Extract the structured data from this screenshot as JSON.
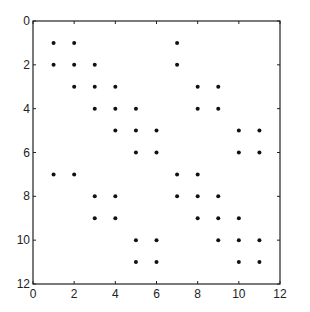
{
  "chart_data": {
    "type": "scatter",
    "subtype": "sparsity-pattern",
    "title": "",
    "xlabel": "",
    "ylabel": "",
    "xlim": [
      0,
      12
    ],
    "ylim": [
      12,
      0
    ],
    "y_inverted": true,
    "grid": false,
    "legend": null,
    "xticks": [
      0,
      2,
      4,
      6,
      8,
      10,
      12
    ],
    "yticks": [
      0,
      2,
      4,
      6,
      8,
      10,
      12
    ],
    "marker": "dot",
    "marker_color": "#111111",
    "points": [
      [
        1,
        1
      ],
      [
        2,
        1
      ],
      [
        7,
        1
      ],
      [
        1,
        2
      ],
      [
        2,
        2
      ],
      [
        3,
        2
      ],
      [
        7,
        2
      ],
      [
        2,
        3
      ],
      [
        3,
        3
      ],
      [
        4,
        3
      ],
      [
        8,
        3
      ],
      [
        9,
        3
      ],
      [
        3,
        4
      ],
      [
        4,
        4
      ],
      [
        5,
        4
      ],
      [
        8,
        4
      ],
      [
        9,
        4
      ],
      [
        4,
        5
      ],
      [
        5,
        5
      ],
      [
        6,
        5
      ],
      [
        10,
        5
      ],
      [
        11,
        5
      ],
      [
        5,
        6
      ],
      [
        6,
        6
      ],
      [
        10,
        6
      ],
      [
        11,
        6
      ],
      [
        1,
        7
      ],
      [
        2,
        7
      ],
      [
        7,
        7
      ],
      [
        8,
        7
      ],
      [
        3,
        8
      ],
      [
        4,
        8
      ],
      [
        7,
        8
      ],
      [
        8,
        8
      ],
      [
        9,
        8
      ],
      [
        3,
        9
      ],
      [
        4,
        9
      ],
      [
        8,
        9
      ],
      [
        9,
        9
      ],
      [
        10,
        9
      ],
      [
        5,
        10
      ],
      [
        6,
        10
      ],
      [
        9,
        10
      ],
      [
        10,
        10
      ],
      [
        11,
        10
      ],
      [
        5,
        11
      ],
      [
        6,
        11
      ],
      [
        10,
        11
      ],
      [
        11,
        11
      ]
    ]
  }
}
